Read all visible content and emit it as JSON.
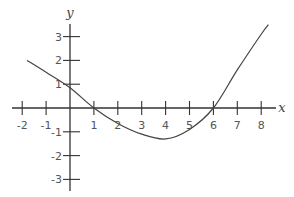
{
  "chart_data": {
    "type": "line",
    "title": "",
    "xlabel": "x",
    "ylabel": "y",
    "xlim": [
      -2.5,
      8.7
    ],
    "ylim": [
      -3.5,
      3.8
    ],
    "x_ticks": [
      -2,
      -1,
      1,
      2,
      3,
      4,
      5,
      6,
      7,
      8
    ],
    "x_tick_labels": [
      "-2",
      "-1",
      "1",
      "2",
      "3",
      "4",
      "5",
      "6",
      "7",
      "8"
    ],
    "y_ticks": [
      3,
      2,
      1,
      -1,
      -2,
      -3
    ],
    "y_tick_labels": [
      "3",
      "2",
      "1",
      "-1",
      "-2",
      "-3"
    ],
    "grid": false,
    "legend": null,
    "series": [
      {
        "name": "f(x)",
        "x": [
          -1.8,
          -1,
          0,
          1,
          2,
          3,
          4,
          5,
          6,
          7,
          8,
          8.3
        ],
        "y": [
          2.0,
          1.5,
          0.85,
          0,
          -0.65,
          -1.1,
          -1.3,
          -0.9,
          0,
          1.6,
          3.1,
          3.5
        ]
      }
    ],
    "annotations": [
      "x-intercepts at x=1 and x=6",
      "local minimum near (4, -1.3)"
    ]
  },
  "colors": {
    "axis": "#333333",
    "curve": "#444444",
    "text": "#555555"
  }
}
